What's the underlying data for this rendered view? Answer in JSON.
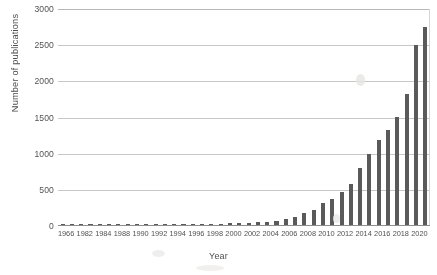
{
  "chart_data": {
    "type": "bar",
    "title": "",
    "xlabel": "Year",
    "ylabel": "Number of publications",
    "ylim": [
      0,
      3000
    ],
    "yticks": [
      0,
      500,
      1000,
      1500,
      2000,
      2500,
      3000
    ],
    "ytick_labels": [
      "0",
      "500",
      "1000",
      "1500",
      "2000",
      "2500",
      "3000"
    ],
    "grid": "horizontal",
    "legend": "none",
    "bar_color": "#555555",
    "categories": [
      "1966",
      "1981",
      "1982",
      "1983",
      "1984",
      "1985",
      "1988",
      "1989",
      "1990",
      "1991",
      "1992",
      "1993",
      "1994",
      "1995",
      "1996",
      "1997",
      "1998",
      "1999",
      "2000",
      "2001",
      "2002",
      "2003",
      "2004",
      "2005",
      "2006",
      "2007",
      "2008",
      "2009",
      "2010",
      "2011",
      "2012",
      "2013",
      "2014",
      "2015",
      "2016",
      "2017",
      "2018",
      "2019",
      "2020",
      "2021"
    ],
    "tick_labels": [
      "1966",
      "",
      "1982",
      "",
      "1984",
      "",
      "1988",
      "",
      "1990",
      "",
      "1992",
      "",
      "1994",
      "",
      "1996",
      "",
      "1998",
      "",
      "2000",
      "",
      "2002",
      "",
      "2004",
      "",
      "2006",
      "",
      "2008",
      "",
      "2010",
      "",
      "2012",
      "",
      "2014",
      "",
      "2016",
      "",
      "2018",
      "",
      "2020",
      ""
    ],
    "values": [
      2,
      3,
      4,
      4,
      5,
      5,
      6,
      7,
      8,
      9,
      10,
      11,
      12,
      13,
      14,
      16,
      18,
      20,
      24,
      28,
      34,
      40,
      48,
      58,
      78,
      110,
      160,
      215,
      300,
      360,
      455,
      575,
      790,
      980,
      1180,
      1320,
      1500,
      1820,
      2500,
      2750
    ]
  }
}
